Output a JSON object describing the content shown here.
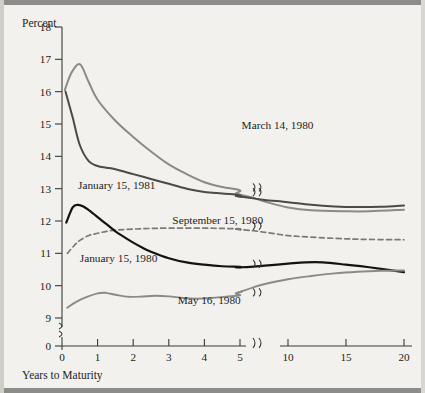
{
  "figure": {
    "y_axis_title": "Percent",
    "x_axis_title": "Years to Maturity",
    "background_color": "#f2f1ed",
    "frame_color": "#8c8c8a"
  },
  "chart_data": {
    "type": "line",
    "title": "",
    "subtitle": "",
    "xlabel": "Years to Maturity",
    "ylabel": "Percent",
    "x_ticks": [
      "0",
      "1",
      "2",
      "3",
      "4",
      "5",
      "10",
      "15",
      "20"
    ],
    "x_tick_values": [
      0,
      1,
      2,
      3,
      4,
      5,
      10,
      15,
      20
    ],
    "y_ticks": [
      "0",
      "9",
      "10",
      "11",
      "12",
      "13",
      "14",
      "15",
      "16",
      "17",
      "18"
    ],
    "y_tick_values": [
      0,
      9,
      10,
      11,
      12,
      13,
      14,
      15,
      16,
      17,
      18
    ],
    "xlim": [
      0,
      20
    ],
    "ylim": [
      9,
      18
    ],
    "y_axis_break": {
      "between": [
        0,
        9
      ],
      "label": "y-axis-break"
    },
    "x_axis_break": {
      "between": [
        5,
        10
      ],
      "label": "x-axis-break"
    },
    "grid": false,
    "legend": "inline-labels",
    "series": [
      {
        "name": "March 14, 1980",
        "color": "#8a8a88",
        "style": "solid",
        "width": 2.0,
        "label_x": 6.0,
        "label_y": 14.85,
        "x": [
          0.08,
          0.25,
          0.5,
          0.75,
          1.0,
          1.5,
          2.0,
          2.5,
          3.0,
          3.5,
          4.0,
          4.5,
          5.0,
          5.5,
          6.0,
          7.0,
          8.0,
          10.0,
          12.0,
          15.0,
          17.0,
          20.0
        ],
        "values": [
          16.05,
          16.55,
          16.85,
          16.3,
          15.75,
          15.1,
          14.6,
          14.15,
          13.75,
          13.45,
          13.2,
          13.05,
          12.95,
          12.85,
          12.8,
          12.72,
          12.6,
          12.42,
          12.33,
          12.3,
          12.3,
          12.35
        ]
      },
      {
        "name": "January 15, 1981",
        "color": "#4a4a48",
        "style": "solid",
        "width": 2.0,
        "label_x": 0.45,
        "label_y": 12.98,
        "x": [
          0.1,
          0.3,
          0.5,
          0.75,
          1.0,
          1.25,
          1.5,
          2.0,
          2.5,
          3.0,
          3.5,
          4.0,
          4.5,
          5.0,
          5.5,
          6.0,
          7.0,
          8.0,
          10.0,
          12.0,
          14.0,
          16.0,
          18.0,
          20.0
        ],
        "values": [
          16.0,
          15.2,
          14.35,
          13.85,
          13.7,
          13.65,
          13.6,
          13.45,
          13.3,
          13.15,
          13.0,
          12.9,
          12.85,
          12.8,
          12.78,
          12.75,
          12.7,
          12.65,
          12.58,
          12.5,
          12.45,
          12.43,
          12.44,
          12.48
        ]
      },
      {
        "name": "September 15, 1980",
        "color": "#7a7a78",
        "style": "dashed",
        "width": 1.7,
        "label_x": 3.1,
        "label_y": 11.92,
        "x": [
          0.15,
          0.35,
          0.5,
          0.75,
          1.0,
          1.25,
          1.5,
          2.0,
          2.5,
          3.0,
          3.5,
          4.0,
          4.5,
          5.0,
          5.5,
          6.0,
          7.0,
          8.0,
          10.0,
          12.0,
          15.0,
          17.0,
          20.0
        ],
        "values": [
          11.0,
          11.25,
          11.4,
          11.55,
          11.62,
          11.68,
          11.72,
          11.75,
          11.77,
          11.78,
          11.78,
          11.78,
          11.77,
          11.76,
          11.75,
          11.73,
          11.7,
          11.65,
          11.55,
          11.5,
          11.45,
          11.43,
          11.42
        ]
      },
      {
        "name": "January 15, 1980",
        "color": "#14140f",
        "style": "solid",
        "width": 2.2,
        "label_x": 0.5,
        "label_y": 10.72,
        "x": [
          0.12,
          0.3,
          0.45,
          0.6,
          0.8,
          1.0,
          1.25,
          1.5,
          1.75,
          2.0,
          2.25,
          2.5,
          3.0,
          3.5,
          4.0,
          4.5,
          5.0,
          5.5,
          6.0,
          7.0,
          8.0,
          10.0,
          11.5,
          13.0,
          15.0,
          17.0,
          20.0
        ],
        "values": [
          11.95,
          12.42,
          12.5,
          12.45,
          12.3,
          12.12,
          11.9,
          11.68,
          11.5,
          11.33,
          11.18,
          11.05,
          10.85,
          10.72,
          10.65,
          10.6,
          10.58,
          10.57,
          10.57,
          10.59,
          10.62,
          10.68,
          10.72,
          10.72,
          10.65,
          10.57,
          10.42
        ]
      },
      {
        "name": "May 16, 1980",
        "color": "#8a8a88",
        "style": "solid",
        "width": 1.9,
        "label_x": 3.25,
        "label_y": 9.42,
        "x": [
          0.15,
          0.4,
          0.7,
          1.0,
          1.2,
          1.5,
          1.8,
          2.2,
          2.6,
          3.0,
          3.4,
          3.8,
          4.2,
          4.6,
          5.0,
          5.5,
          6.0,
          7.0,
          8.0,
          10.0,
          12.0,
          14.0,
          16.0,
          18.0,
          20.0
        ],
        "values": [
          9.32,
          9.5,
          9.65,
          9.76,
          9.78,
          9.72,
          9.66,
          9.66,
          9.69,
          9.67,
          9.62,
          9.6,
          9.62,
          9.66,
          9.7,
          9.76,
          9.82,
          9.95,
          10.05,
          10.2,
          10.3,
          10.38,
          10.43,
          10.46,
          10.47
        ]
      }
    ]
  }
}
